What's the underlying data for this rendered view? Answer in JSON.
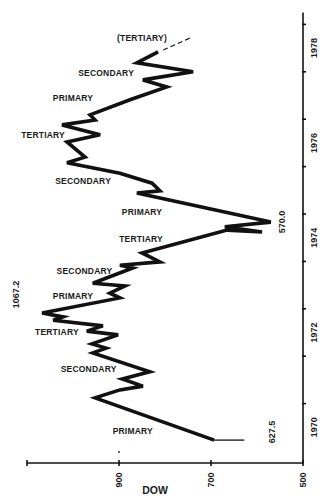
{
  "chart_data": {
    "type": "line",
    "orientation": "rotated-90 (time runs bottom-to-top on the right axis; DOW decreases left-to-right on the bottom axis)",
    "title": "",
    "xlabel": "DOW",
    "ylabel": "",
    "dow_axis": {
      "label": "DOW",
      "range": [
        1100,
        500
      ],
      "ticks": [
        1100,
        900,
        700,
        500
      ],
      "tick_labels": [
        "",
        "900",
        "700",
        "500"
      ]
    },
    "time_axis": {
      "range": [
        1970,
        1979
      ],
      "ticks": [
        1970,
        1971,
        1972,
        1973,
        1974,
        1975,
        1976,
        1977,
        1978,
        1979
      ],
      "tick_labels": [
        {
          "text": "1970",
          "at": 1970.5
        },
        {
          "text": "1972",
          "at": 1972.5
        },
        {
          "text": "1974",
          "at": 1974.5
        },
        {
          "text": "1976",
          "at": 1976.5
        },
        {
          "text": "1978",
          "at": 1978.5
        }
      ]
    },
    "grid": false,
    "legend": null,
    "series": [
      {
        "name": "Initial low (thin)",
        "style": "thin",
        "points": [
          [
            1970.23,
            627.5
          ],
          [
            1970.23,
            693
          ]
        ]
      },
      {
        "name": "DOW Jones Industrial Average",
        "style": "thick",
        "points": [
          [
            1970.23,
            693
          ],
          [
            1971.12,
            952
          ],
          [
            1971.29,
            898
          ],
          [
            1971.37,
            848
          ],
          [
            1971.52,
            893
          ],
          [
            1971.67,
            833
          ],
          [
            1972.07,
            957
          ],
          [
            1972.17,
            928
          ],
          [
            1972.26,
            959
          ],
          [
            1972.45,
            902
          ],
          [
            1972.53,
            970
          ],
          [
            1972.64,
            935
          ],
          [
            1972.76,
            1043
          ],
          [
            1972.83,
            1022
          ],
          [
            1972.91,
            1067.2
          ],
          [
            1973.23,
            898
          ],
          [
            1973.33,
            920
          ],
          [
            1973.48,
            887
          ],
          [
            1973.54,
            957
          ],
          [
            1973.86,
            870
          ],
          [
            1973.92,
            898
          ],
          [
            1973.99,
            811
          ],
          [
            1974.18,
            850
          ],
          [
            1974.66,
            665
          ],
          [
            1974.62,
            589
          ],
          [
            1974.73,
            670
          ],
          [
            1974.83,
            570.0
          ],
          [
            1975.44,
            861
          ],
          [
            1975.49,
            811
          ],
          [
            1975.65,
            828
          ],
          [
            1975.86,
            898
          ],
          [
            1976.08,
            1013
          ],
          [
            1976.2,
            974
          ],
          [
            1976.52,
            1013
          ],
          [
            1976.67,
            941
          ],
          [
            1976.88,
            1024
          ],
          [
            1976.98,
            952
          ],
          [
            1977.09,
            963
          ],
          [
            1977.41,
            876
          ],
          [
            1977.68,
            796
          ],
          [
            1977.83,
            848
          ],
          [
            1978.0,
            739
          ],
          [
            1978.19,
            861
          ],
          [
            1978.42,
            815
          ]
        ]
      },
      {
        "name": "Projected (dashed)",
        "style": "dashed",
        "points": [
          [
            1978.46,
            804
          ],
          [
            1978.71,
            746
          ]
        ]
      }
    ],
    "annotations": [
      {
        "text": "627.5",
        "type": "value",
        "year": 1970.4,
        "dow": 560
      },
      {
        "text": "1067.2",
        "type": "value",
        "year": 1973.3,
        "dow": 1118
      },
      {
        "text": "570.0",
        "type": "value",
        "year": 1974.83,
        "dow": 540
      },
      {
        "text": "PRIMARY",
        "type": "phase",
        "year": 1970.42,
        "dow": 870
      },
      {
        "text": "SECONDARY",
        "type": "phase",
        "year": 1971.73,
        "dow": 966
      },
      {
        "text": "TERTIARY",
        "type": "phase",
        "year": 1972.51,
        "dow": 1035
      },
      {
        "text": "PRIMARY",
        "type": "phase",
        "year": 1973.28,
        "dow": 1000
      },
      {
        "text": "SECONDARY",
        "type": "phase",
        "year": 1973.8,
        "dow": 975
      },
      {
        "text": "TERTIARY",
        "type": "phase",
        "year": 1974.48,
        "dow": 852
      },
      {
        "text": "PRIMARY",
        "type": "phase",
        "year": 1975.04,
        "dow": 850
      },
      {
        "text": "SECONDARY",
        "type": "phase",
        "year": 1975.7,
        "dow": 978
      },
      {
        "text": "TERTIARY",
        "type": "phase",
        "year": 1976.67,
        "dow": 1065
      },
      {
        "text": "PRIMARY",
        "type": "phase",
        "year": 1977.45,
        "dow": 1000
      },
      {
        "text": "SECONDARY",
        "type": "phase",
        "year": 1977.98,
        "dow": 928
      },
      {
        "text": "(TERTIARY)",
        "type": "phase",
        "year": 1978.71,
        "dow": 850
      }
    ],
    "stray_mark": {
      "year": 1970.0,
      "dow": 900
    }
  }
}
